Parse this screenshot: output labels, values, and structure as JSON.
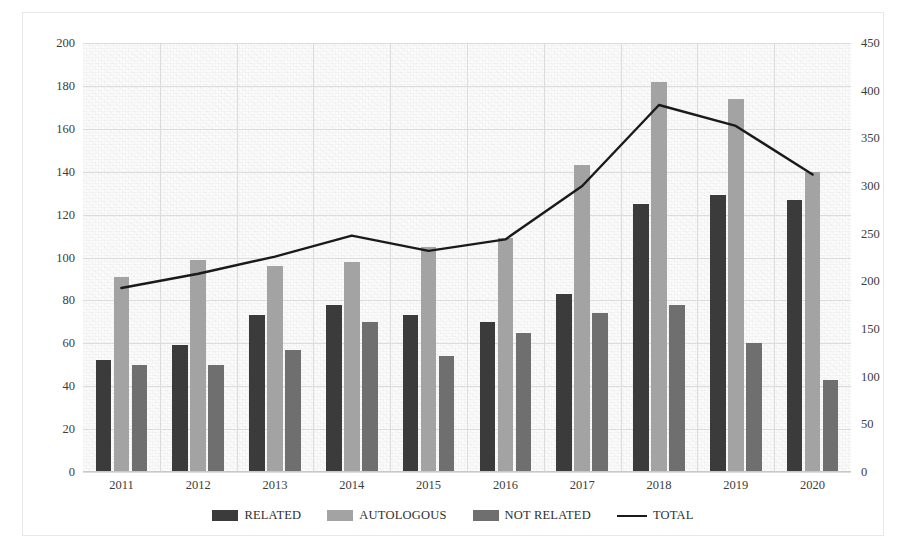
{
  "chart_data": {
    "type": "bar",
    "title": "",
    "subtitle": "",
    "xlabel": "",
    "ylabel": "",
    "categories": [
      "2011",
      "2012",
      "2013",
      "2014",
      "2015",
      "2016",
      "2017",
      "2018",
      "2019",
      "2020"
    ],
    "series": [
      {
        "name": "RELATED",
        "axis": "left",
        "color": "#3b3b3b",
        "values": [
          52,
          59,
          73,
          78,
          73,
          70,
          83,
          125,
          129,
          127
        ]
      },
      {
        "name": "AUTOLOGOUS",
        "axis": "left",
        "color": "#a3a3a3",
        "values": [
          91,
          99,
          96,
          98,
          105,
          109,
          143,
          182,
          174,
          140
        ]
      },
      {
        "name": "NOT RELATED",
        "axis": "left",
        "color": "#6f6f6f",
        "values": [
          50,
          50,
          57,
          70,
          54,
          65,
          74,
          78,
          60,
          43
        ]
      },
      {
        "name": "TOTAL",
        "axis": "right",
        "color": "#1a1a1a",
        "type": "line",
        "values": [
          193,
          208,
          226,
          248,
          232,
          244,
          300,
          385,
          363,
          312
        ]
      }
    ],
    "ylim": [
      0,
      200
    ],
    "ytick_step": 20,
    "yticks": [
      "0",
      "20",
      "40",
      "60",
      "80",
      "100",
      "120",
      "140",
      "160",
      "180",
      "200"
    ],
    "ylim_right": [
      0,
      450
    ],
    "ytick_step_right": 50,
    "yticks_right": [
      "0",
      "50",
      "100",
      "150",
      "200",
      "250",
      "300",
      "350",
      "400",
      "450"
    ],
    "grid": true,
    "legend_position": "bottom",
    "legend": [
      "RELATED",
      "AUTOLOGOUS",
      "NOT RELATED",
      "TOTAL"
    ],
    "colors": {
      "related": "#3b3b3b",
      "autologous": "#a3a3a3",
      "not_related": "#6f6f6f",
      "total_line": "#1a1a1a",
      "gridline": "#dcdcdc",
      "plot_background": "#fbfbfb",
      "frame_border": "#e8e8e8"
    }
  }
}
